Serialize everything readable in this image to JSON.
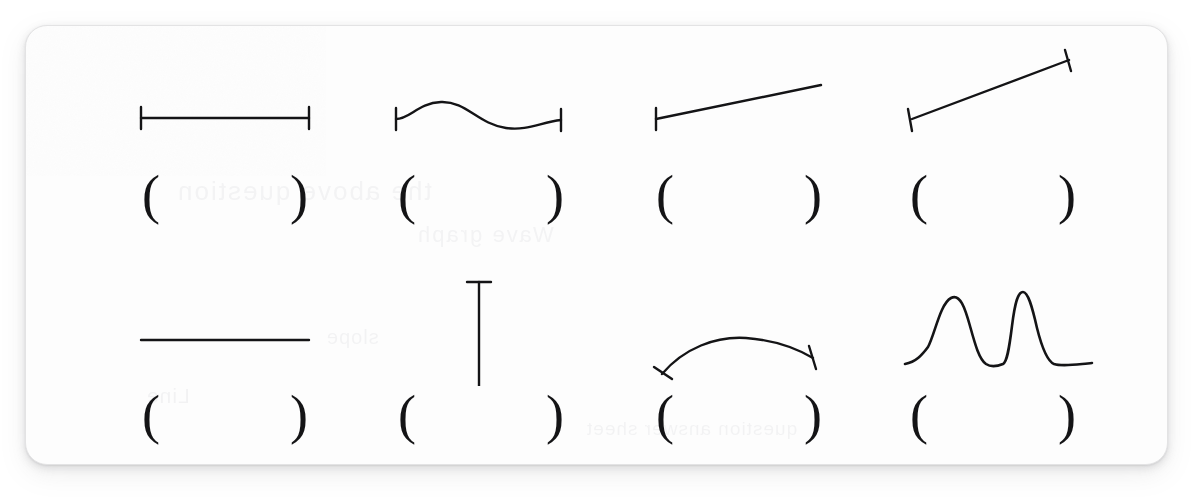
{
  "page": {
    "background_color": "#ffffff",
    "card_background_color": "#fdfdfd",
    "card_border_color": "#e3e3e4",
    "ink_color": "#141416"
  },
  "ghost_text": {
    "note": "faint mirrored bleed-through from the reverse side of the scanned page",
    "lines": [
      "the above question",
      "Wave graph",
      "slope",
      "Line",
      "question answer sheet"
    ]
  },
  "worksheet": {
    "rows": 2,
    "columns": 4,
    "open_paren": "(",
    "close_paren": ")",
    "items": [
      {
        "index": 1,
        "row": 0,
        "column": 0,
        "glyph_name": "horizontal-line-with-end-caps",
        "description": "flat horizontal line segment with vertical tick end caps at both ends",
        "answer": ""
      },
      {
        "index": 2,
        "row": 0,
        "column": 1,
        "glyph_name": "s-curve-wave-with-end-caps",
        "description": "gentle S shaped sine wave rising then falling, vertical tick end caps at both ends",
        "answer": ""
      },
      {
        "index": 3,
        "row": 0,
        "column": 2,
        "glyph_name": "gentle-upward-slope-line",
        "description": "shallow upward sloping straight line, vertical tick cap at left end only",
        "answer": ""
      },
      {
        "index": 4,
        "row": 0,
        "column": 3,
        "glyph_name": "steep-upward-slope-line-with-end-caps",
        "description": "steeper upward sloping straight line with perpendicular tick caps at both ends",
        "answer": ""
      },
      {
        "index": 5,
        "row": 1,
        "column": 0,
        "glyph_name": "plain-horizontal-line",
        "description": "flat horizontal line segment with no end caps",
        "answer": ""
      },
      {
        "index": 6,
        "row": 1,
        "column": 1,
        "glyph_name": "vertical-line-with-end-caps",
        "description": "vertical line segment with horizontal tick caps at top and bottom",
        "answer": ""
      },
      {
        "index": 7,
        "row": 1,
        "column": 2,
        "glyph_name": "concave-down-arc-with-end-caps",
        "description": "arc curving upward then down, concave down, tick caps at both ends",
        "answer": ""
      },
      {
        "index": 8,
        "row": 1,
        "column": 3,
        "glyph_name": "double-peak-curve",
        "description": "curve rising to a rounded first peak, dipping, then a tall narrow second peak, then flattening to a plateau",
        "answer": ""
      }
    ]
  }
}
